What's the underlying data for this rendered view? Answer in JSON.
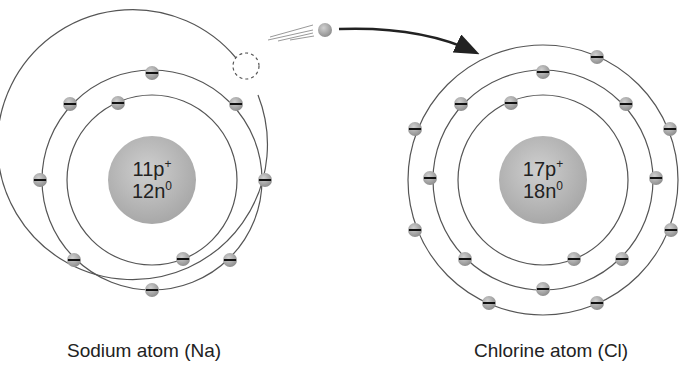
{
  "atoms": [
    {
      "name": "Sodium atom (Na)",
      "nucleus": {
        "protons": "11p",
        "proton_sup": "+",
        "neutrons": "12n",
        "neutron_sup": "0"
      },
      "center": [
        152,
        180
      ],
      "shells": [
        {
          "r": 85,
          "electrons": 2
        },
        {
          "r": 110,
          "electrons": 8
        },
        {
          "r": 135,
          "electrons": 1,
          "note": "lost electron (dashed)"
        }
      ]
    },
    {
      "name": "Chlorine atom (Cl)",
      "nucleus": {
        "protons": "17p",
        "proton_sup": "+",
        "neutrons": "18n",
        "neutron_sup": "0"
      },
      "center": [
        543,
        180
      ],
      "shells": [
        {
          "r": 85,
          "electrons": 2
        },
        {
          "r": 110,
          "electrons": 8
        },
        {
          "r": 135,
          "electrons": 7
        }
      ]
    }
  ],
  "transfer": {
    "description": "electron moving from sodium to chlorine",
    "icon": "moving-electron-icon"
  },
  "colors": {
    "line": "#555555",
    "electron": "#a8a8a8",
    "nucleus": "#b5b5b5",
    "text": "#222222"
  }
}
